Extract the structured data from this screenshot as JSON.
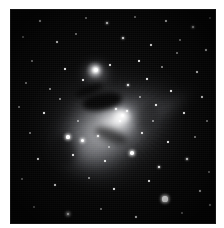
{
  "image": {
    "kind": "astrophotograph",
    "subject": "Orion Nebula (M42)",
    "secondary_subject": "De Mairan's Nebula (M43)",
    "palette": "monochrome",
    "caption_text": ""
  },
  "frame": {
    "mat_color": "#ffffff",
    "plate_background": "#040404",
    "mat_left_px": 10,
    "mat_top_px": 9,
    "mat_right_px": 8,
    "mat_bottom_px": 4,
    "plate_width_px": 206,
    "plate_height_px": 215
  },
  "nebula": {
    "core_highlight_color": "#ffffff",
    "mid_glow_color": "#c9cbd3",
    "outer_halo_color": "#6e7079",
    "dust_lane_color": "#000000",
    "core_center": {
      "x": 112,
      "y": 107
    },
    "m43_center": {
      "x": 88,
      "y": 66
    },
    "regions": [
      {
        "name": "outer-halo",
        "label": "Outer halo"
      },
      {
        "name": "main-body",
        "label": "Main glowing body"
      },
      {
        "name": "core",
        "label": "Huygensian region core"
      },
      {
        "name": "trapezium-glow",
        "label": "Trapezium blaze"
      },
      {
        "name": "south-wing",
        "label": "Southern wing"
      },
      {
        "name": "ne-streamers",
        "label": "North-east streamers"
      },
      {
        "name": "east-arc",
        "label": "Eastern arc"
      },
      {
        "name": "filaments",
        "label": "Radial filaments"
      },
      {
        "name": "m43",
        "label": "M43 detached patch"
      },
      {
        "name": "fish-mouth",
        "label": "Fish's Mouth dark intrusion"
      }
    ]
  },
  "stars": [
    {
      "x": 30,
      "y": 12,
      "r": 0.9,
      "mag": "sml"
    },
    {
      "x": 76,
      "y": 9,
      "r": 0.8,
      "mag": "fnt"
    },
    {
      "x": 97,
      "y": 14,
      "r": 1.3,
      "mag": "med"
    },
    {
      "x": 125,
      "y": 8,
      "r": 0.7,
      "mag": "fnt"
    },
    {
      "x": 156,
      "y": 12,
      "r": 0.9,
      "mag": "sml"
    },
    {
      "x": 183,
      "y": 18,
      "r": 1.1,
      "mag": "med"
    },
    {
      "x": 200,
      "y": 9,
      "r": 0.8,
      "mag": "fnt"
    },
    {
      "x": 13,
      "y": 28,
      "r": 0.8,
      "mag": "fnt"
    },
    {
      "x": 47,
      "y": 33,
      "r": 1.0,
      "mag": "sml"
    },
    {
      "x": 66,
      "y": 25,
      "r": 0.8,
      "mag": "fnt"
    },
    {
      "x": 113,
      "y": 29,
      "r": 1.2,
      "mag": "med"
    },
    {
      "x": 141,
      "y": 36,
      "r": 0.9,
      "mag": "sml"
    },
    {
      "x": 170,
      "y": 31,
      "r": 0.8,
      "mag": "fnt"
    },
    {
      "x": 196,
      "y": 41,
      "r": 1.0,
      "mag": "sml"
    },
    {
      "x": 22,
      "y": 52,
      "r": 0.8,
      "mag": "fnt"
    },
    {
      "x": 55,
      "y": 60,
      "r": 0.9,
      "mag": "sml"
    },
    {
      "x": 86,
      "y": 61,
      "r": 2.3,
      "mag": "big"
    },
    {
      "x": 100,
      "y": 56,
      "r": 1.0,
      "mag": "sml"
    },
    {
      "x": 129,
      "y": 52,
      "r": 0.9,
      "mag": "sml"
    },
    {
      "x": 152,
      "y": 58,
      "r": 0.8,
      "mag": "fnt"
    },
    {
      "x": 187,
      "y": 63,
      "r": 1.0,
      "mag": "sml"
    },
    {
      "x": 16,
      "y": 74,
      "r": 0.8,
      "mag": "fnt"
    },
    {
      "x": 40,
      "y": 80,
      "r": 0.8,
      "mag": "fnt"
    },
    {
      "x": 73,
      "y": 71,
      "r": 0.9,
      "mag": "sml"
    },
    {
      "x": 118,
      "y": 76,
      "r": 1.1,
      "mag": "med"
    },
    {
      "x": 137,
      "y": 70,
      "r": 0.9,
      "mag": "sml"
    },
    {
      "x": 161,
      "y": 82,
      "r": 1.0,
      "mag": "sml"
    },
    {
      "x": 192,
      "y": 88,
      "r": 0.9,
      "mag": "sml"
    },
    {
      "x": 9,
      "y": 98,
      "r": 0.8,
      "mag": "fnt"
    },
    {
      "x": 34,
      "y": 104,
      "r": 0.9,
      "mag": "sml"
    },
    {
      "x": 106,
      "y": 100,
      "r": 1.4,
      "mag": "med"
    },
    {
      "x": 112,
      "y": 106,
      "r": 1.5,
      "mag": "med"
    },
    {
      "x": 117,
      "y": 102,
      "r": 1.2,
      "mag": "med"
    },
    {
      "x": 110,
      "y": 112,
      "r": 1.2,
      "mag": "med"
    },
    {
      "x": 146,
      "y": 96,
      "r": 0.9,
      "mag": "sml"
    },
    {
      "x": 174,
      "y": 104,
      "r": 1.0,
      "mag": "sml"
    },
    {
      "x": 197,
      "y": 112,
      "r": 0.8,
      "mag": "fnt"
    },
    {
      "x": 20,
      "y": 124,
      "r": 0.8,
      "mag": "fnt"
    },
    {
      "x": 58,
      "y": 128,
      "r": 1.6,
      "mag": "big"
    },
    {
      "x": 72,
      "y": 131,
      "r": 1.5,
      "mag": "big"
    },
    {
      "x": 88,
      "y": 127,
      "r": 1.3,
      "mag": "med"
    },
    {
      "x": 132,
      "y": 124,
      "r": 1.0,
      "mag": "sml"
    },
    {
      "x": 158,
      "y": 133,
      "r": 0.9,
      "mag": "sml"
    },
    {
      "x": 185,
      "y": 128,
      "r": 0.8,
      "mag": "fnt"
    },
    {
      "x": 28,
      "y": 150,
      "r": 0.9,
      "mag": "sml"
    },
    {
      "x": 63,
      "y": 146,
      "r": 0.9,
      "mag": "sml"
    },
    {
      "x": 95,
      "y": 152,
      "r": 1.0,
      "mag": "sml"
    },
    {
      "x": 122,
      "y": 144,
      "r": 1.8,
      "mag": "big"
    },
    {
      "x": 149,
      "y": 158,
      "r": 1.4,
      "mag": "med"
    },
    {
      "x": 177,
      "y": 150,
      "r": 1.1,
      "mag": "med"
    },
    {
      "x": 199,
      "y": 163,
      "r": 0.8,
      "mag": "fnt"
    },
    {
      "x": 12,
      "y": 170,
      "r": 0.8,
      "mag": "fnt"
    },
    {
      "x": 45,
      "y": 176,
      "r": 0.9,
      "mag": "sml"
    },
    {
      "x": 79,
      "y": 169,
      "r": 0.8,
      "mag": "fnt"
    },
    {
      "x": 104,
      "y": 180,
      "r": 0.9,
      "mag": "sml"
    },
    {
      "x": 139,
      "y": 172,
      "r": 1.0,
      "mag": "sml"
    },
    {
      "x": 155,
      "y": 190,
      "r": 2.6,
      "mag": "big"
    },
    {
      "x": 190,
      "y": 182,
      "r": 0.9,
      "mag": "sml"
    },
    {
      "x": 24,
      "y": 198,
      "r": 0.8,
      "mag": "fnt"
    },
    {
      "x": 58,
      "y": 205,
      "r": 1.4,
      "mag": "big"
    },
    {
      "x": 91,
      "y": 200,
      "r": 0.8,
      "mag": "fnt"
    },
    {
      "x": 126,
      "y": 208,
      "r": 0.9,
      "mag": "sml"
    },
    {
      "x": 172,
      "y": 204,
      "r": 0.8,
      "mag": "fnt"
    },
    {
      "x": 200,
      "y": 196,
      "r": 0.9,
      "mag": "sml"
    },
    {
      "x": 50,
      "y": 90,
      "r": 0.7,
      "mag": "fnt"
    },
    {
      "x": 167,
      "y": 44,
      "r": 0.7,
      "mag": "fnt"
    },
    {
      "x": 143,
      "y": 112,
      "r": 0.8,
      "mag": "fnt"
    },
    {
      "x": 99,
      "y": 138,
      "r": 0.8,
      "mag": "fnt"
    },
    {
      "x": 68,
      "y": 112,
      "r": 0.8,
      "mag": "fnt"
    },
    {
      "x": 130,
      "y": 88,
      "r": 0.8,
      "mag": "fnt"
    }
  ]
}
